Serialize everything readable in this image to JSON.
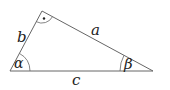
{
  "diagram": {
    "type": "right-triangle",
    "labels": {
      "side_a": "a",
      "side_b": "b",
      "side_c": "c",
      "angle_alpha": "α",
      "angle_beta": "β",
      "right_angle_mark": "·"
    },
    "colors": {
      "stroke": "#666666",
      "text": "#222222"
    }
  }
}
